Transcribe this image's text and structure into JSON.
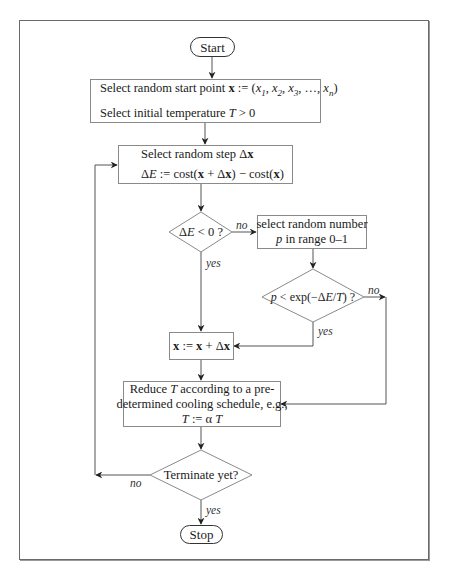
{
  "diagram": {
    "frame": {
      "border_color": "#6a6a6a"
    },
    "nodes": {
      "start": {
        "type": "terminal",
        "label": "Start"
      },
      "init": {
        "type": "process",
        "line1_prefix": "Select random start point ",
        "line1_var": "x",
        "line1_assign": " := (",
        "line1_terms": [
          "x1",
          "x2",
          "x3",
          "…",
          "xn"
        ],
        "line1_text": "Select random start point x := (x1, x2, x3, …, xn)",
        "line2_prefix": "Select initial temperature ",
        "line2_var": "T",
        "line2_suffix": " > 0",
        "line2_text": "Select initial temperature T > 0"
      },
      "step": {
        "type": "process",
        "line1_prefix": "Select random step Δ",
        "line1_var": "x",
        "line1_text": "Select random step Δx",
        "line2_text": "ΔE := cost(x + Δx) − cost(x)"
      },
      "decision_delta": {
        "type": "decision",
        "label": "ΔE < 0 ?"
      },
      "random_p": {
        "type": "process",
        "line1": "select random number",
        "line2_var": "p",
        "line2_suffix": " in range 0–1",
        "line2_text": "p in range 0–1"
      },
      "decision_accept": {
        "type": "decision",
        "label": "p < exp(−ΔE/T) ?"
      },
      "update_x": {
        "type": "process",
        "label": "x := x + Δx"
      },
      "cool": {
        "type": "process",
        "line1_prefix": "Reduce ",
        "line1_var": "T",
        "line1_suffix": " according to a pre-",
        "line2": "determined cooling schedule, e.g.,",
        "line3_text": "T := α T"
      },
      "decision_terminate": {
        "type": "decision",
        "label": "Terminate yet?"
      },
      "stop": {
        "type": "terminal",
        "label": "Stop"
      }
    },
    "edge_labels": {
      "delta_no": "no",
      "delta_yes": "yes",
      "accept_no": "no",
      "accept_yes": "yes",
      "terminate_no": "no",
      "terminate_yes": "yes"
    },
    "edges": [
      {
        "from": "start",
        "to": "init"
      },
      {
        "from": "init",
        "to": "step"
      },
      {
        "from": "step",
        "to": "decision_delta"
      },
      {
        "from": "decision_delta",
        "to": "random_p",
        "label": "no"
      },
      {
        "from": "decision_delta",
        "to": "update_x",
        "label": "yes"
      },
      {
        "from": "random_p",
        "to": "decision_accept"
      },
      {
        "from": "decision_accept",
        "to": "update_x",
        "label": "yes"
      },
      {
        "from": "decision_accept",
        "to": "cool",
        "label": "no"
      },
      {
        "from": "update_x",
        "to": "cool"
      },
      {
        "from": "cool",
        "to": "decision_terminate"
      },
      {
        "from": "decision_terminate",
        "to": "step",
        "label": "no"
      },
      {
        "from": "decision_terminate",
        "to": "stop",
        "label": "yes"
      }
    ]
  }
}
